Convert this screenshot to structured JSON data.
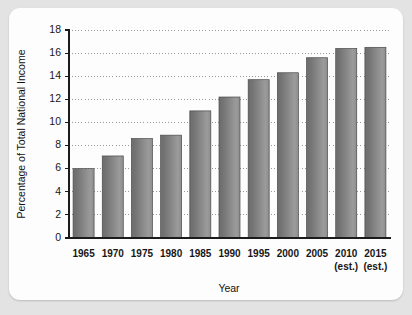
{
  "chart_data": {
    "type": "bar",
    "title": "",
    "subtitle": "",
    "xlabel": "Year",
    "ylabel": "Percentage of Total National Income",
    "categories": [
      "1965",
      "1970",
      "1975",
      "1980",
      "1985",
      "1990",
      "1995",
      "2000",
      "2005",
      "2010",
      "2015"
    ],
    "category_sublabels": [
      "",
      "",
      "",
      "",
      "",
      "",
      "",
      "",
      "",
      "(est.)",
      "(est.)"
    ],
    "values": [
      6.0,
      7.1,
      8.6,
      8.9,
      11.0,
      12.2,
      13.7,
      14.3,
      15.6,
      16.4,
      16.5
    ],
    "series": [
      {
        "name": "Percentage of Total National Income",
        "values": [
          6.0,
          7.1,
          8.6,
          8.9,
          11.0,
          12.2,
          13.7,
          14.3,
          15.6,
          16.4,
          16.5
        ]
      }
    ],
    "ylim": [
      0,
      18
    ],
    "ytick_values": [
      0,
      2,
      4,
      6,
      8,
      10,
      12,
      14,
      16,
      18
    ],
    "ytick_labels": [
      "0",
      "2",
      "4",
      "6",
      "8",
      "10",
      "12",
      "14",
      "16",
      "18"
    ],
    "grid": true,
    "grid_axis": "y",
    "grid_style": "dotted",
    "legend": false,
    "legend_position": "none",
    "annotations": [],
    "bar_color": "#787878",
    "bar_color_dark": "#616161",
    "bar_color_light": "#a8a8a8",
    "axis_color": "#1b1b1b",
    "grid_color": "#8e8e8e",
    "background_color": "#fdfdfd",
    "page_background_color": "#e3e3e3"
  },
  "layout": {
    "plot_left": 60,
    "plot_right": 381,
    "plot_top": 22,
    "plot_bottom": 230,
    "bar_width": 21,
    "xlabel_y": 249,
    "xsub_y": 262,
    "axis_title_y": 284,
    "ylabel_x": 16,
    "ylabel_y": 126
  }
}
